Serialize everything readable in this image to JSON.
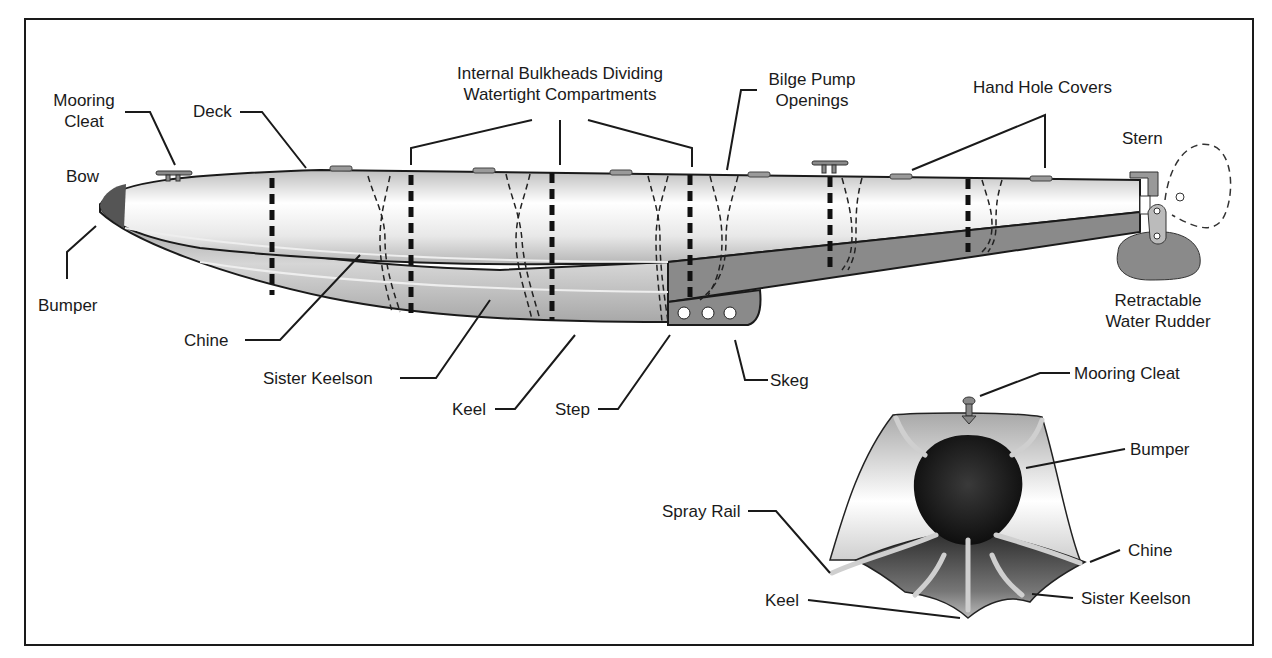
{
  "diagram": {
    "side_view": {
      "labels": {
        "mooring_cleat_line1": "Mooring",
        "mooring_cleat_line2": "Cleat",
        "deck": "Deck",
        "bulkheads_line1": "Internal Bulkheads Dividing",
        "bulkheads_line2": "Watertight Compartments",
        "bilge_line1": "Bilge Pump",
        "bilge_line2": "Openings",
        "hand_hole": "Hand Hole Covers",
        "stern": "Stern",
        "bow": "Bow",
        "bumper": "Bumper",
        "chine": "Chine",
        "sister_keelson": "Sister Keelson",
        "keel": "Keel",
        "step": "Step",
        "skeg": "Skeg",
        "rudder_line1": "Retractable",
        "rudder_line2": "Water Rudder"
      }
    },
    "front_view": {
      "labels": {
        "mooring_cleat": "Mooring Cleat",
        "bumper": "Bumper",
        "spray_rail": "Spray Rail",
        "chine": "Chine",
        "keel": "Keel",
        "sister_keelson": "Sister Keelson"
      }
    },
    "colors": {
      "outline": "#1a1a1a",
      "hull_light": "#f4f4f4",
      "hull_mid": "#c8c8c8",
      "hull_dark": "#7a7a7a",
      "bumper": "#151515"
    }
  }
}
